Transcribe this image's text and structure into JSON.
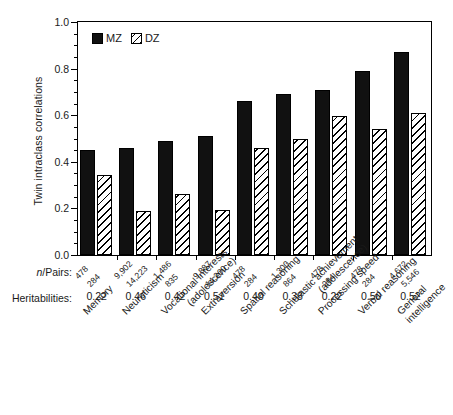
{
  "chart_data": {
    "type": "bar",
    "title": "",
    "xlabel": "",
    "ylabel": "Twin intraclass correlations",
    "ylim": [
      0.0,
      1.0
    ],
    "ytick_labels": [
      "0.0",
      "0.2",
      "0.4",
      "0.6",
      "0.8",
      "1.0"
    ],
    "ytick_values": [
      0.0,
      0.2,
      0.4,
      0.6,
      0.8,
      1.0
    ],
    "minor_tick_step": 0.05,
    "grid": false,
    "legend_position": "top-left",
    "categories": [
      "Memory",
      "Neuroticism",
      "Vocational interests (adolescence)",
      "Extraversion",
      "Spatial reasoning",
      "Scholastic achievement (adolescence)",
      "Processing speed",
      "Verbal reasoning",
      "General intelligence"
    ],
    "series": [
      {
        "name": "MZ",
        "values": [
          0.45,
          0.46,
          0.49,
          0.51,
          0.66,
          0.69,
          0.71,
          0.79,
          0.87
        ]
      },
      {
        "name": "DZ",
        "values": [
          0.345,
          0.19,
          0.26,
          0.195,
          0.46,
          0.5,
          0.595,
          0.54,
          0.61
        ]
      }
    ],
    "annotation_rows": [
      {
        "label": "n/Pairs:",
        "label_italic_prefix": "n",
        "label_rest": "/Pairs:",
        "values_mz": [
          "478",
          "9,902",
          "1,486",
          "9,887",
          "478",
          "1,300",
          "478",
          "478",
          "4,672"
        ],
        "values_dz": [
          "284",
          "14,223",
          "835",
          "14,200",
          "284",
          "864",
          "284",
          "284",
          "5,546"
        ]
      },
      {
        "label": "Heritabilities:",
        "values": [
          "0.22",
          "0.46",
          "0.42",
          "0.51",
          "0.40",
          "0.38",
          "0.22",
          "0.50",
          "0.52"
        ]
      }
    ]
  },
  "legend": {
    "items": [
      {
        "label": "MZ",
        "swatch": "solid-black-square"
      },
      {
        "label": "DZ",
        "swatch": "hatched-square"
      }
    ]
  },
  "colors": {
    "mz_fill": "#111111",
    "dz_fill": "#ffffff",
    "hatch": "#000000",
    "axis": "#000000",
    "text": "#1a1a1a",
    "background": "#ffffff"
  },
  "category_labels_wrapped": [
    {
      "line1": "Memory",
      "line2": ""
    },
    {
      "line1": "Neuroticism",
      "line2": ""
    },
    {
      "line1": "Vocational interests",
      "line2": "(adolescence)"
    },
    {
      "line1": "Extraversion",
      "line2": ""
    },
    {
      "line1": "Spatial reasoning",
      "line2": ""
    },
    {
      "line1": "Scholastic achievement",
      "line2": "(adolescence)"
    },
    {
      "line1": "Processing speed",
      "line2": ""
    },
    {
      "line1": "Verbal reasoning",
      "line2": ""
    },
    {
      "line1": "General",
      "line2": "intelligence"
    }
  ]
}
